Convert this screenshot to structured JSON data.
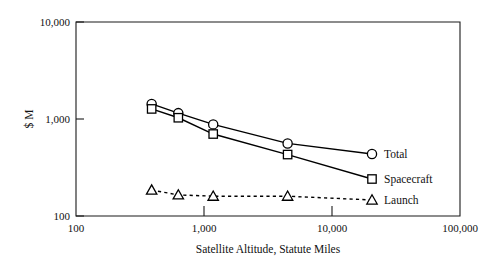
{
  "chart_data": {
    "type": "line",
    "title": "",
    "subtitle": "",
    "xlabel": "Satellite Altitude, Statute Miles",
    "ylabel": "$ M",
    "xscale": "log",
    "yscale": "log",
    "xlim": [
      100,
      100000
    ],
    "ylim": [
      100,
      10000
    ],
    "grid": false,
    "legend_position": "right-inside-plot",
    "xticks": [
      100,
      1000,
      10000,
      100000
    ],
    "xtick_labels": [
      "100",
      "1,000",
      "10,000",
      "100,000"
    ],
    "yticks": [
      100,
      1000,
      10000
    ],
    "ytick_labels": [
      "100",
      "1,000",
      "10,000"
    ],
    "x": [
      390,
      630,
      1180,
      4500
    ],
    "series": [
      {
        "name": "Total",
        "marker": "circle",
        "linestyle": "solid",
        "values": [
          1430,
          1150,
          880,
          560
        ]
      },
      {
        "name": "Spacecraft",
        "marker": "square",
        "linestyle": "solid",
        "values": [
          1270,
          1030,
          700,
          430
        ]
      },
      {
        "name": "Launch",
        "marker": "triangle",
        "linestyle": "dashed",
        "values": [
          185,
          165,
          160,
          160
        ]
      }
    ]
  },
  "axes": {
    "x_title": "Satellite Altitude, Statute Miles",
    "y_title": "$ M",
    "x_tick_labels": [
      "100",
      "1,000",
      "10,000",
      "100,000"
    ],
    "y_tick_labels": [
      "10,000",
      "1,000",
      "100"
    ]
  },
  "legend": {
    "entries": [
      {
        "label": "Total",
        "marker": "circle-marker-icon"
      },
      {
        "label": "Spacecraft",
        "marker": "square-marker-icon"
      },
      {
        "label": "Launch",
        "marker": "triangle-marker-icon"
      }
    ]
  },
  "colors": {
    "ink": "#000000",
    "frame": "#1a1a1a",
    "background": "#ffffff",
    "marker_fill": "#ffffff"
  }
}
